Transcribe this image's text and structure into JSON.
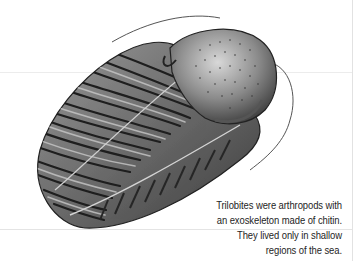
{
  "illustration": {
    "subject": "trilobite",
    "style": "grayscale engraving",
    "colors": {
      "background": "#ffffff",
      "shell_dark": "#2a2a2a",
      "shell_mid": "#7a7a7a",
      "shell_light": "#cfcfcf"
    }
  },
  "caption": {
    "lines": [
      "Trilobites were arthropods with",
      "an exoskeleton made of chitin.",
      "They lived only in shallow",
      "regions of the sea."
    ]
  }
}
